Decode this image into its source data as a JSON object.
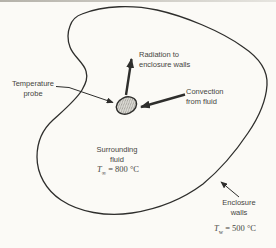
{
  "figure": {
    "background": "#fbfaf6",
    "line_color": "#2e2e2c",
    "text_color": "#46453f",
    "probe_fill": "#dddcd6"
  },
  "labels": {
    "radiation": "Radiation to\nenclosure walls",
    "temperature_probe": "Temperature\nprobe",
    "convection": "Convection\nfrom fluid",
    "surrounding_fluid": "Surrounding\nfluid",
    "enclosure_walls": "Enclosure\nwalls"
  },
  "values": {
    "fluid_temp": {
      "symbol": "T",
      "subscript": "∞",
      "value": "= 800 °C"
    },
    "wall_temp": {
      "symbol": "T",
      "subscript": "w",
      "value": "= 500 °C"
    }
  }
}
